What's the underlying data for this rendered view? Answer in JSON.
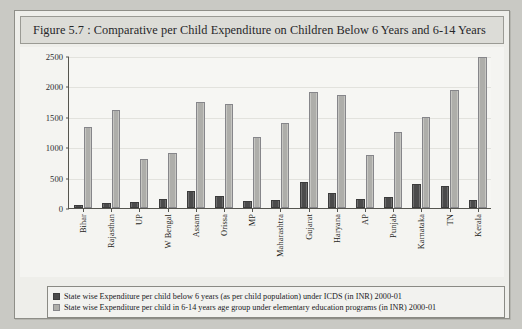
{
  "figure": {
    "caption": "Figure 5.7 : Comparative per Child Expenditure on Children Below 6 Years and 6-14 Years"
  },
  "legend": {
    "series1_label": "State wise Expenditure per child below 6 years (as per child population) under ICDS (in INR) 2000-01",
    "series2_label": "State wise Expenditure per child in 6-14 years age group under elementary education programs (in INR) 2000-01",
    "series1_swatch": "dark-square-icon",
    "series2_swatch": "light-square-icon"
  },
  "chart_data": {
    "type": "bar",
    "title": "Figure 5.7 : Comparative per Child Expenditure on Children Below 6 Years and 6-14 Years",
    "xlabel": "",
    "ylabel": "",
    "ylim": [
      0,
      2500
    ],
    "yticks": [
      0,
      500,
      1000,
      1500,
      2000,
      2500
    ],
    "grid": true,
    "legend_position": "bottom",
    "categories": [
      "Bihar",
      "Rajasthan",
      "UP",
      "W Bengal",
      "Assam",
      "Orissa",
      "MP",
      "Maharashtra",
      "Gujarat",
      "Haryana",
      "AP",
      "Punjab",
      "Karnataka",
      "TN",
      "Kerala"
    ],
    "series": [
      {
        "name": "State wise Expenditure per child below 6 years (as per child population) under ICDS (in INR) 2000-01",
        "color": "#4b4b4b",
        "values": [
          50,
          75,
          100,
          155,
          280,
          190,
          110,
          140,
          430,
          250,
          150,
          175,
          390,
          370,
          130
        ]
      },
      {
        "name": "State wise Expenditure per child in 6-14 years age group under elementary education programs (in INR) 2000-01",
        "color": "#aeaeaa",
        "values": [
          1335,
          1620,
          800,
          900,
          1750,
          1705,
          1160,
          1400,
          1910,
          1860,
          870,
          1250,
          1505,
          1935,
          2480
        ]
      }
    ]
  }
}
